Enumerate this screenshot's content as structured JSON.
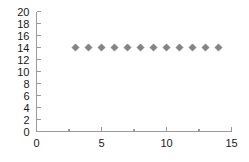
{
  "chart_data": {
    "type": "scatter",
    "title": "",
    "subtitle": "",
    "xlabel": "",
    "ylabel": "",
    "xlim": [
      0,
      15
    ],
    "ylim": [
      0,
      20
    ],
    "grid": false,
    "legend": null,
    "x": [
      3,
      4,
      5,
      6,
      7,
      8,
      9,
      10,
      11,
      12,
      13,
      14
    ],
    "values": [
      14,
      14,
      14,
      14,
      14,
      14,
      14,
      14,
      14,
      14,
      14,
      14
    ],
    "series": [
      {
        "name": "",
        "marker": "diamond",
        "color": "#848484",
        "x": [
          3,
          4,
          5,
          6,
          7,
          8,
          9,
          10,
          11,
          12,
          13,
          14
        ],
        "values": [
          14,
          14,
          14,
          14,
          14,
          14,
          14,
          14,
          14,
          14,
          14,
          14
        ]
      }
    ],
    "y_ticks": [
      0,
      2,
      4,
      6,
      8,
      10,
      12,
      14,
      16,
      18,
      20
    ],
    "y_tick_labels": [
      "0",
      "2",
      "4",
      "6",
      "8",
      "10",
      "12",
      "14",
      "16",
      "18",
      "20"
    ],
    "x_ticks": [
      0,
      5,
      10,
      15
    ],
    "x_tick_labels": [
      "0",
      "5",
      "10",
      "15"
    ],
    "x_minor_ticks": [
      2.5,
      7.5,
      12.5
    ],
    "colors": {
      "marker": "#848484",
      "marker_edge": "#6e6e6e",
      "axis": "#9a9a9a",
      "text": "#1a1a1a",
      "background": "#ffffff"
    }
  }
}
